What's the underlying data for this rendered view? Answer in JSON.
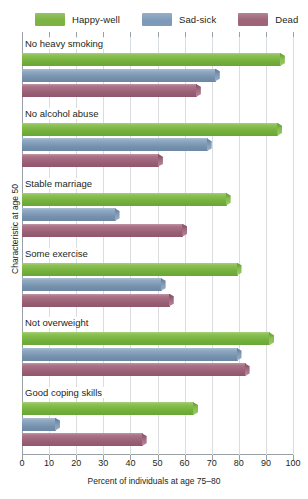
{
  "legend": {
    "items": [
      {
        "label": "Happy-well",
        "color": "#7cb342",
        "name": "legend-happy-well"
      },
      {
        "label": "Sad-sick",
        "color": "#7d9bb9",
        "name": "legend-sad-sick"
      },
      {
        "label": "Dead",
        "color": "#9e6478",
        "name": "legend-dead"
      }
    ]
  },
  "axes": {
    "xlabel": "Percent of individuals at age 75–80",
    "ylabel": "Characteristic at age 50",
    "xticks": [
      0,
      10,
      20,
      30,
      40,
      50,
      60,
      70,
      80,
      90,
      100
    ]
  },
  "chart_data": {
    "type": "bar",
    "orientation": "horizontal",
    "title": "",
    "xlabel": "Percent of individuals at age 75–80",
    "ylabel": "Characteristic at age 50",
    "xlim": [
      0,
      100
    ],
    "xticks": [
      0,
      10,
      20,
      30,
      40,
      50,
      60,
      70,
      80,
      90,
      100
    ],
    "grid": true,
    "legend_position": "top",
    "categories": [
      "No heavy smoking",
      "No alcohol abuse",
      "Stable marriage",
      "Some exercise",
      "Not overweight",
      "Good coping skills"
    ],
    "series": [
      {
        "name": "Happy-well",
        "color": "#7cb342",
        "values": [
          97,
          96,
          77,
          81,
          93,
          65
        ]
      },
      {
        "name": "Sad-sick",
        "color": "#7d9bb9",
        "values": [
          73,
          70,
          36,
          53,
          81,
          14
        ]
      },
      {
        "name": "Dead",
        "color": "#9e6478",
        "values": [
          66,
          52,
          61,
          56,
          84,
          46
        ]
      }
    ]
  }
}
